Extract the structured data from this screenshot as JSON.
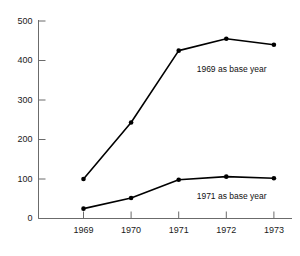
{
  "chart_data": {
    "type": "line",
    "title": "",
    "subtitle": "",
    "xlabel": "",
    "ylabel": "",
    "categories": [
      "1969",
      "1970",
      "1971",
      "1972",
      "1973"
    ],
    "x": [
      1969,
      1970,
      1971,
      1972,
      1973
    ],
    "xlim": [
      1968.5,
      1973.5
    ],
    "ylim": [
      0,
      500
    ],
    "yticks": [
      "0",
      "100",
      "200",
      "300",
      "400",
      "500"
    ],
    "ytick_values": [
      0,
      100,
      200,
      300,
      400,
      500
    ],
    "xticks": [
      "1969",
      "1970",
      "1971",
      "1972",
      "1973"
    ],
    "grid": false,
    "legend": "none",
    "annotations": [
      {
        "text": "1969 as base year",
        "series": "1969 as base year"
      },
      {
        "text": "1971 as base year",
        "series": "1971 as base year"
      }
    ],
    "series": [
      {
        "name": "1969 as base year",
        "values": [
          100,
          243,
          425,
          455,
          440
        ],
        "color": "#000000",
        "marker": "circle"
      },
      {
        "name": "1971 as base year",
        "values": [
          25,
          52,
          98,
          106,
          102
        ],
        "color": "#000000",
        "marker": "circle"
      }
    ]
  },
  "axes": {
    "axis_color": "#6b6b6b",
    "line_color": "#000000",
    "marker_color": "#000000",
    "background": "#ffffff"
  }
}
